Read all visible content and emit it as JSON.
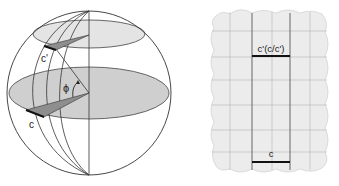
{
  "sphere_figure": {
    "labels": {
      "phi": "ϕ",
      "c": "c",
      "c_prime": "c'"
    },
    "colors": {
      "outline": "#333333",
      "equator_fill": "#cfcfcf",
      "small_circle_fill": "#e4e4e4",
      "wedge_fill": "#8e8e8e",
      "arc_highlight": "#111111"
    }
  },
  "map_figure": {
    "labels": {
      "top_segment": "c'(c/c')",
      "bottom_segment": "c"
    },
    "colors": {
      "background": "#ececec",
      "grid": "#b5b5b5",
      "meridian": "#666666",
      "segment": "#111111"
    }
  }
}
